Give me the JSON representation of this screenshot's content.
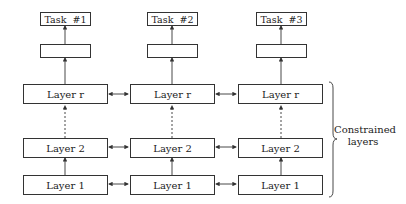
{
  "diagram": {
    "columns": [
      {
        "task_label": "Task  #1",
        "layers": [
          {
            "label": "Layer r"
          },
          {
            "label": "Layer 2"
          },
          {
            "label": "Layer 1"
          }
        ]
      },
      {
        "task_label": "Task  #2",
        "layers": [
          {
            "label": "Layer r"
          },
          {
            "label": "Layer 2"
          },
          {
            "label": "Layer 1"
          }
        ]
      },
      {
        "task_label": "Task  #3",
        "layers": [
          {
            "label": "Layer r"
          },
          {
            "label": "Layer 2"
          },
          {
            "label": "Layer 1"
          }
        ]
      }
    ],
    "brace_label_line1": "Constrained",
    "brace_label_line2": "layers",
    "colors": {
      "stroke": "#333333",
      "background": "#ffffff"
    }
  }
}
